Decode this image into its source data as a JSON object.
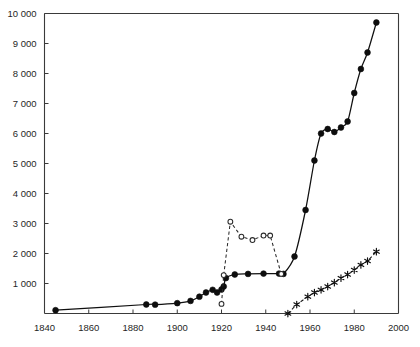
{
  "chart_data": {
    "type": "line",
    "title": "",
    "subtitle": "",
    "xlabel": "",
    "ylabel": "",
    "xlim": [
      1840,
      2000
    ],
    "ylim": [
      0,
      10000
    ],
    "xticks": [
      1840,
      1860,
      1880,
      1900,
      1920,
      1940,
      1960,
      1980,
      2000
    ],
    "xtick_labels": [
      "1840",
      "1860",
      "1880",
      "1900",
      "1920",
      "1940",
      "1960",
      "1980",
      "2000"
    ],
    "yticks": [
      1000,
      2000,
      3000,
      4000,
      5000,
      6000,
      7000,
      8000,
      9000,
      10000
    ],
    "ytick_labels": [
      "1 000",
      "2 000",
      "3 000",
      "4 000",
      "5 000",
      "6 000",
      "7 000",
      "8 000",
      "9 000",
      "10 000"
    ],
    "grid": false,
    "legend": null,
    "axis_style": "left-and-top-spines-box",
    "series": [
      {
        "name": "main-solid-filled-circles",
        "style": "solid",
        "marker": "filled-circle",
        "color": "#0d0d0d",
        "x": [
          1845,
          1886,
          1890,
          1900,
          1906,
          1910,
          1913,
          1916,
          1918,
          1920,
          1921,
          1922,
          1926,
          1932,
          1939,
          1946,
          1948,
          1953,
          1958,
          1962,
          1965,
          1968,
          1971,
          1974,
          1977,
          1980,
          1983,
          1986,
          1990
        ],
        "y": [
          110,
          300,
          295,
          345,
          420,
          560,
          700,
          790,
          700,
          800,
          900,
          1180,
          1300,
          1320,
          1330,
          1330,
          1320,
          1900,
          3450,
          5100,
          6000,
          6150,
          6050,
          6200,
          6400,
          7350,
          8150,
          8700,
          9700
        ]
      },
      {
        "name": "dashed-open-circles",
        "style": "dashed",
        "marker": "open-circle",
        "color": "#2b2b2b",
        "x": [
          1920,
          1921,
          1924,
          1929,
          1934,
          1939,
          1942,
          1947
        ],
        "y": [
          320,
          1280,
          3060,
          2560,
          2450,
          2600,
          2600,
          1320
        ]
      },
      {
        "name": "dashed-asterisks",
        "style": "dashed",
        "marker": "asterisk",
        "color": "#0d0d0d",
        "x": [
          1950,
          1954,
          1959,
          1962,
          1965,
          1968,
          1971,
          1974,
          1977,
          1980,
          1983,
          1986,
          1990
        ],
        "y": [
          0,
          300,
          560,
          700,
          790,
          900,
          1030,
          1180,
          1300,
          1450,
          1620,
          1750,
          2060
        ]
      }
    ]
  }
}
